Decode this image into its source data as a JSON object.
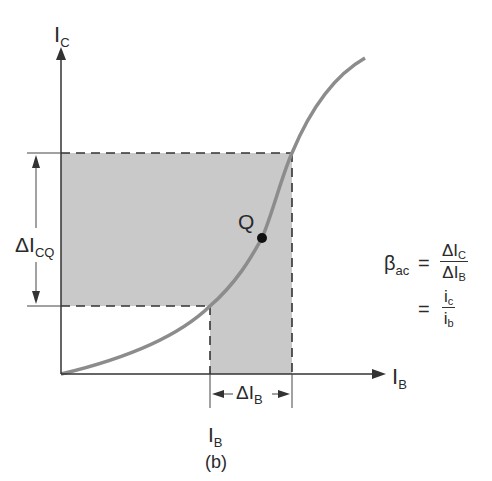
{
  "figure": {
    "caption": "(b)",
    "y_axis_label": "I",
    "y_axis_sub": "C",
    "x_axis_label": "I",
    "x_axis_sub": "B",
    "q_point_label": "Q",
    "delta_icq_label": "ΔI",
    "delta_icq_sub": "CQ",
    "delta_ib_label": "ΔI",
    "delta_ib_sub": "B",
    "ib_tick_label": "I",
    "ib_tick_sub": "B"
  },
  "formula": {
    "lhs": "β",
    "lhs_sub": "ac",
    "eq1": "=",
    "num1": "ΔI",
    "num1_sub": "C",
    "den1": "ΔI",
    "den1_sub": "B",
    "eq2": "=",
    "num2": "i",
    "num2_sub": "c",
    "den2": "i",
    "den2_sub": "b"
  },
  "colors": {
    "shade": "#c8c8c8",
    "curve": "#8c8c8c",
    "axis": "#333333"
  }
}
